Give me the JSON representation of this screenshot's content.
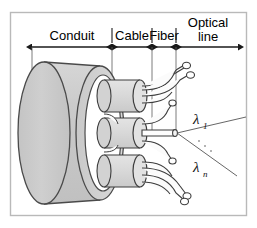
{
  "figure": {
    "background_color": "#ffffff",
    "frame_color": "#b9b9b9",
    "line_color": "#1a1a1a",
    "body_fill": "#cccccc",
    "body_fill_light": "#dcdcdc",
    "bore_fill": "#ffffff",
    "ray_color": "#555555"
  },
  "dimensions": {
    "labels": [
      {
        "id": "conduit",
        "text": "Conduit",
        "x1": 32,
        "x2": 112,
        "label_x": 72,
        "label_y": 35
      },
      {
        "id": "cable",
        "text": "Cable",
        "x1": 112,
        "x2": 152,
        "label_x": 132,
        "label_y": 35
      },
      {
        "id": "fiber",
        "text": "Fiber",
        "x1": 152,
        "x2": 176,
        "label_x": 164,
        "label_y": 35
      },
      {
        "id": "optical-line",
        "text": "Optical",
        "text2": "line",
        "x1": 176,
        "x2": 238,
        "label_x": 207,
        "label_y": 22
      }
    ],
    "axis_y": 47
  },
  "annotations": {
    "wavelength_first": {
      "symbol": "λ",
      "subscript": "1",
      "x": 196,
      "y": 124
    },
    "wavelength_last": {
      "symbol": "λ",
      "subscript": "n",
      "x": 196,
      "y": 172
    },
    "ray_origin": {
      "x": 176,
      "y": 133
    },
    "ellipsis": "·"
  },
  "parts": {
    "conduit": {
      "name": "conduit-body",
      "label": "Conduit"
    },
    "cables": [
      {
        "name": "cable-top",
        "label": "Cable",
        "cy": 96
      },
      {
        "name": "cable-middle",
        "label": "Cable",
        "cy": 133
      },
      {
        "name": "cable-bottom",
        "label": "Cable",
        "cy": 171
      }
    ],
    "fiber_count_per_cable": 3,
    "optical_line": {
      "name": "optical-line",
      "label": "Optical line"
    }
  }
}
